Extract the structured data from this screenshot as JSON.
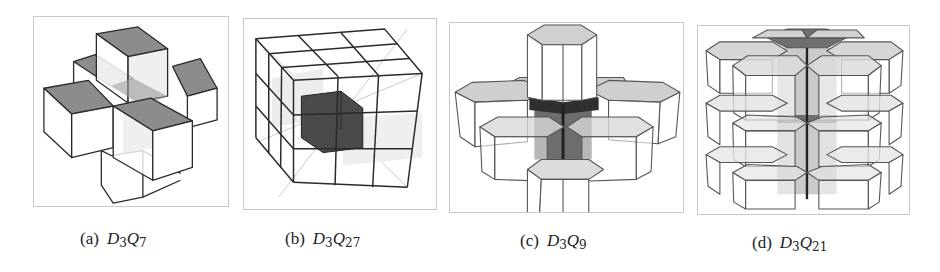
{
  "figure": {
    "panels": [
      {
        "label": "(a)",
        "symbol": "D",
        "sub1": "3",
        "symbol2": "Q",
        "sub2": "7",
        "description": "D3Q7 lattice: center cube with 6 face neighbors (cross shape)"
      },
      {
        "label": "(b)",
        "symbol": "D",
        "sub1": "3",
        "symbol2": "Q",
        "sub2": "27",
        "description": "D3Q27 lattice: 3x3x3 cube grid with dark center cube"
      },
      {
        "label": "(c)",
        "symbol": "D",
        "sub1": "3",
        "symbol2": "Q",
        "sub2": "9",
        "description": "D3Q9 lattice: hexagonal prism center with 6 in-plane neighbors plus top and bottom"
      },
      {
        "label": "(d)",
        "symbol": "D",
        "sub1": "3",
        "symbol2": "Q",
        "sub2": "21",
        "description": "D3Q21 lattice: three stacked layers of 7 hexagonal prisms"
      }
    ],
    "colors": {
      "frame": "#c8c8c8",
      "edge": "#2a2a2a",
      "face_gray": "#8c8c8c",
      "face_light": "#d9d9d9",
      "center_dark": "#4a4a4a"
    }
  }
}
